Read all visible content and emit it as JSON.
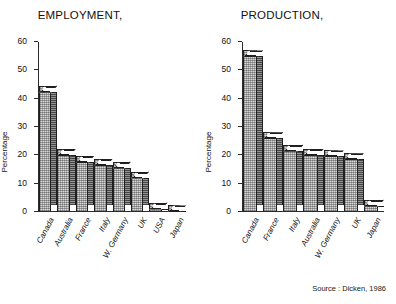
{
  "figure": {
    "source_note": "Source : Dicken, 1986",
    "ylabel": "Percentage",
    "yticks": [
      "0",
      "10",
      "20",
      "30",
      "40",
      "50",
      "60"
    ]
  },
  "panels": [
    {
      "title": "EMPLOYMENT,"
    },
    {
      "title": "PRODUCTION,"
    }
  ],
  "chart_data": [
    {
      "type": "bar",
      "title": "EMPLOYMENT,",
      "xlabel": "",
      "ylabel": "Percentage",
      "ylim": [
        0,
        60
      ],
      "yticks": [
        0,
        10,
        20,
        30,
        40,
        50,
        60
      ],
      "grid": false,
      "legend": "none",
      "categories": [
        "Canada",
        "Australia",
        "France",
        "Italy",
        "W. Germany",
        "UK",
        "USA",
        "Japan"
      ],
      "values": [
        44.5,
        22,
        19.5,
        18.5,
        17.5,
        14,
        3,
        2
      ]
    },
    {
      "type": "bar",
      "title": "PRODUCTION,",
      "xlabel": "",
      "ylabel": "Percentage",
      "ylim": [
        0,
        60
      ],
      "yticks": [
        0,
        10,
        20,
        30,
        40,
        50,
        60
      ],
      "grid": false,
      "legend": "none",
      "categories": [
        "Canada",
        "France",
        "Italy",
        "Australia",
        "W. Germany",
        "UK",
        "Japan"
      ],
      "values": [
        57,
        28,
        23.5,
        22,
        21.5,
        20.5,
        4
      ]
    }
  ]
}
